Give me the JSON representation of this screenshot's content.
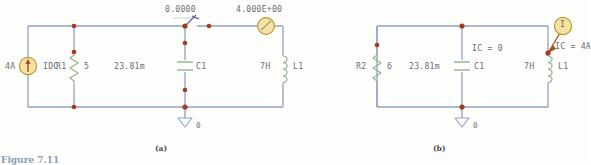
{
  "figure": {
    "caption_partial": "Figure 7.11",
    "subcaption_a": "(a)",
    "subcaption_b": "(b)"
  },
  "colors": {
    "wire": "#8fa3bd",
    "node": "#a43a20",
    "component": "#8fb58f",
    "source_fill": "#f5e2a0",
    "source_stroke": "#b89a3c",
    "text": "#6e6e72",
    "ground": "#8fa3bd"
  },
  "circuit_a": {
    "label": "(a)",
    "meter_reading": "0.0000",
    "source_reading": "4.000E+00",
    "current_source": {
      "value": "4A",
      "name": "IDC",
      "icon": "current-source-arrow-up"
    },
    "resistor": {
      "name": "R1",
      "value": "5"
    },
    "capacitor": {
      "value": "23.81m",
      "name": "C1"
    },
    "inductor": {
      "value": "7H",
      "name": "L1"
    },
    "ground": {
      "label": "0"
    },
    "switch": {
      "icon": "open-switch"
    }
  },
  "circuit_b": {
    "label": "(b)",
    "resistor": {
      "name": "R2",
      "value": "6"
    },
    "capacitor": {
      "value": "23.81m",
      "name": "C1",
      "ic": "IC = 0"
    },
    "inductor": {
      "value": "7H",
      "name": "L1",
      "ic": "IC = 4A"
    },
    "ground": {
      "label": "0"
    },
    "marker": {
      "glyph": "I",
      "icon": "initial-condition-marker"
    }
  }
}
